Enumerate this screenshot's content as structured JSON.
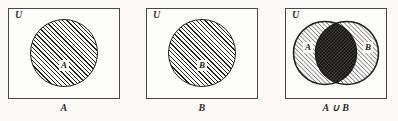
{
  "figure": {
    "kind": "venn-diagram-set",
    "universe_label": "U",
    "union_symbol": "∪"
  },
  "panels": [
    {
      "id": "panel-set-a",
      "universe_label": "U",
      "caption": "A",
      "circles": [
        {
          "label": "A",
          "fill": "hatched"
        }
      ]
    },
    {
      "id": "panel-set-b",
      "universe_label": "U",
      "caption": "B",
      "circles": [
        {
          "label": "B",
          "fill": "hatched"
        }
      ]
    },
    {
      "id": "panel-union-a-b",
      "universe_label": "U",
      "caption": "A ∪ B",
      "circles": [
        {
          "label": "A",
          "fill": "hatched"
        },
        {
          "label": "B",
          "fill": "hatched"
        }
      ],
      "intersection_fill": "dark-dense"
    }
  ],
  "colors": {
    "paper": "#fbfaf7",
    "box_fill": "#fdfdfb",
    "box_border": "#4a4843",
    "circle_border": "#201f1c",
    "hatch_ink": "#26241f",
    "dense_ink": "#121110",
    "text_ink": "#2e2c28"
  }
}
